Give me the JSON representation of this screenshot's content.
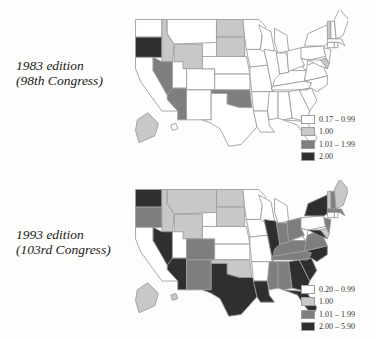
{
  "chart_data": [
    {
      "type": "heatmap",
      "subtype": "choropleth-map",
      "title": "1983 edition",
      "subtitle": "(98th Congress)",
      "legend": [
        {
          "label": "0.17 – 0.99",
          "color": "#ffffff"
        },
        {
          "label": "1.00",
          "color": "#c8c8c8"
        },
        {
          "label": "1.01 – 1.99",
          "color": "#7e7e7e"
        },
        {
          "label": "2.00",
          "color": "#2f2f2f"
        }
      ],
      "states": {
        "WA": 0,
        "OR": 3,
        "CA": 0,
        "ID": 1,
        "NV": 2,
        "MT": 0,
        "WY": 1,
        "UT": 0,
        "AZ": 2,
        "CO": 0,
        "NM": 0,
        "ND": 1,
        "SD": 1,
        "NE": 0,
        "KS": 0,
        "OK": 2,
        "TX": 0,
        "MN": 0,
        "IA": 0,
        "MO": 0,
        "AR": 0,
        "LA": 0,
        "WI": 0,
        "IL": 0,
        "MI": 0,
        "IN": 0,
        "OH": 0,
        "KY": 0,
        "TN": 0,
        "MS": 0,
        "AL": 0,
        "GA": 0,
        "FL": 0,
        "SC": 0,
        "NC": 0,
        "VA": 0,
        "WV": 0,
        "PA": 0,
        "NY": 0,
        "NJ": 0,
        "DE": 1,
        "MD": 0,
        "CT": 0,
        "RI": 0,
        "MA": 0,
        "VT": 1,
        "NH": 0,
        "ME": 0,
        "AK": 1,
        "HI": 0
      }
    },
    {
      "type": "heatmap",
      "subtype": "choropleth-map",
      "title": "1993 edition",
      "subtitle": "(103rd Congress)",
      "legend": [
        {
          "label": "0.20 – 0.99",
          "color": "#ffffff"
        },
        {
          "label": "1.00",
          "color": "#c8c8c8"
        },
        {
          "label": "1.01 – 1.99",
          "color": "#7e7e7e"
        },
        {
          "label": "2.00 – 5.90",
          "color": "#2f2f2f"
        }
      ],
      "states": {
        "WA": 3,
        "OR": 2,
        "CA": 0,
        "ID": 1,
        "NV": 3,
        "MT": 1,
        "WY": 1,
        "UT": 0,
        "AZ": 3,
        "CO": 2,
        "NM": 2,
        "ND": 1,
        "SD": 1,
        "NE": 0,
        "KS": 0,
        "OK": 1,
        "TX": 3,
        "MN": 0,
        "IA": 0,
        "MO": 0,
        "AR": 0,
        "LA": 3,
        "WI": 0,
        "IL": 3,
        "MI": 0,
        "IN": 2,
        "OH": 2,
        "KY": 2,
        "TN": 2,
        "MS": 2,
        "AL": 2,
        "GA": 3,
        "FL": 3,
        "SC": 3,
        "NC": 3,
        "VA": 2,
        "WV": 0,
        "PA": 0,
        "NY": 3,
        "NJ": 2,
        "DE": 1,
        "MD": 3,
        "CT": 0,
        "RI": 0,
        "MA": 2,
        "VT": 1,
        "NH": 2,
        "ME": 1,
        "AK": 1,
        "HI": 1
      }
    }
  ]
}
